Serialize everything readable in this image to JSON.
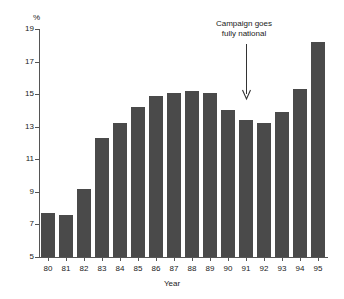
{
  "chart_data": {
    "type": "bar",
    "title": "",
    "subtitle": "",
    "xlabel": "Year",
    "ylabel": "%",
    "categories": [
      "80",
      "81",
      "82",
      "83",
      "84",
      "85",
      "86",
      "87",
      "88",
      "89",
      "90",
      "91",
      "92",
      "93",
      "94",
      "95"
    ],
    "values": [
      7.7,
      7.6,
      9.2,
      12.3,
      13.2,
      14.2,
      14.9,
      15.1,
      15.2,
      15.1,
      14.0,
      13.4,
      13.25,
      13.9,
      15.3,
      18.2
    ],
    "ylim": [
      5,
      19
    ],
    "ytick_labels": [
      "5",
      "7",
      "9",
      "11",
      "13",
      "15",
      "17",
      "19"
    ],
    "ytick_values": [
      5,
      7,
      9,
      11,
      13,
      15,
      17,
      19
    ],
    "grid": false,
    "legend": "none",
    "bar_color": "#4a4a4a",
    "axis_color": "#555555",
    "annotations": [
      {
        "text_line1": "Campaign goes",
        "text_line2": "fully national",
        "points_to_category": "91",
        "arrow": "down-arrow"
      }
    ]
  },
  "axis": {
    "y_unit_label": "%",
    "x_title": "Year"
  }
}
